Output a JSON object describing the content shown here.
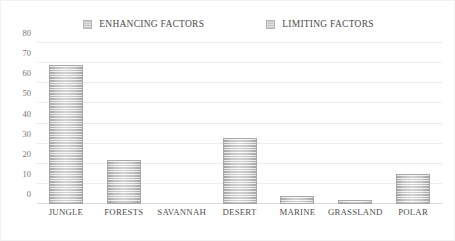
{
  "legend": {
    "entries": [
      {
        "label": "ENHANCING FACTORS",
        "swatch": "legend-swatch-icon",
        "color": "#c9c9c9"
      },
      {
        "label": "LIMITING FACTORS",
        "swatch": "legend-swatch-icon",
        "color": "#c9c9c9"
      }
    ]
  },
  "axis": {
    "y_ticks": [
      "0",
      "10",
      "20",
      "30",
      "40",
      "50",
      "60",
      "70",
      "80"
    ]
  },
  "chart_data": {
    "type": "bar",
    "title": "",
    "subtitle": "",
    "xlabel": "",
    "ylabel": "",
    "ylim": [
      0,
      80
    ],
    "ytick_step": 10,
    "grid": true,
    "legend_position": "top-center",
    "categories": [
      "JUNGLE",
      "FORESTS",
      "SAVANNAH",
      "DESERT",
      "MARINE",
      "GRASSLAND",
      "POLAR"
    ],
    "series": [
      {
        "name": "ENHANCING FACTORS",
        "color": "#d2d2d2",
        "values": [
          69,
          22,
          0,
          33,
          4,
          2,
          15
        ]
      }
    ],
    "annotations": []
  }
}
